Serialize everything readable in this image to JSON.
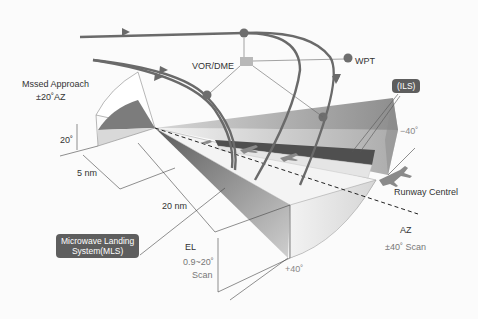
{
  "diagram": {
    "labels": {
      "missed_approach": "Mssed Approach",
      "missed_approach_az": "±20˚AZ",
      "vor_dme": "VOR/DME",
      "wpt": "WPT",
      "ils": "(ILS)",
      "minus40": "−40˚",
      "plus40": "+40˚",
      "elev20": "20˚",
      "dist5": "5 nm",
      "dist20": "20 nm",
      "mls_line1": "Microwave Landing",
      "mls_line2": "System(MLS)",
      "el": "EL",
      "el_range": "0.9~20˚",
      "el_scan": "Scan",
      "runway_centre": "Runway Centrel",
      "az": "AZ",
      "az_scan": "±40˚ Scan"
    },
    "colors": {
      "background": "#fbfbfb",
      "flight_path": "#6a6a6a",
      "badge_bg": "#5e5e5e",
      "badge_text": "#ffffff",
      "waypoint_dot": "#6e6e6e",
      "vor_box": "#b8b8b8",
      "az_fill_dark": "#6f6f6f",
      "az_fill_light": "#e6e6e6",
      "runway": "#555555",
      "centreline": "#222222"
    },
    "icons": [
      "aircraft-icon",
      "waypoint-dot-icon",
      "vor-dme-station-icon",
      "arrow-icon"
    ]
  }
}
